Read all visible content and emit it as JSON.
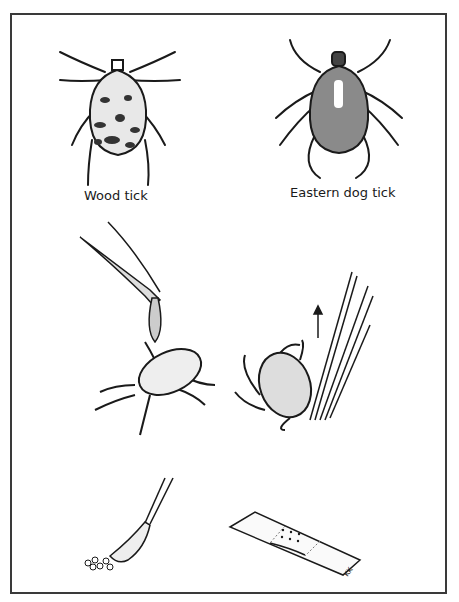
{
  "figure": {
    "type": "instructional-illustration",
    "labels": {
      "wood_tick": "Wood tick",
      "eastern_dog_tick": "Eastern dog tick"
    },
    "panels": [
      {
        "id": "wood-tick",
        "label": "Wood tick"
      },
      {
        "id": "eastern-dog-tick",
        "label": "Eastern dog tick"
      },
      {
        "id": "apply-drop",
        "description": "Dropper applying a drop onto an attached tick"
      },
      {
        "id": "tweezers-removal",
        "description": "Tweezers pulling tick straight up",
        "arrow": "up"
      },
      {
        "id": "swab-disinfect",
        "description": "Cotton swab cleaning the bite area"
      },
      {
        "id": "bandage",
        "description": "Adhesive bandage covering the bite"
      }
    ],
    "signature": "KK",
    "colors": {
      "ink": "#1a1a1a",
      "background": "#ffffff",
      "frame": "#3a3a3a"
    }
  }
}
